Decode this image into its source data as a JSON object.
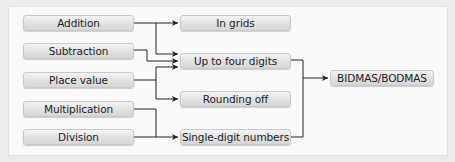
{
  "diagram": {
    "type": "flowchart",
    "left_column": [
      {
        "id": "addition",
        "label": "Addition"
      },
      {
        "id": "subtraction",
        "label": "Subtraction"
      },
      {
        "id": "place_value",
        "label": "Place value"
      },
      {
        "id": "multiplication",
        "label": "Multiplication"
      },
      {
        "id": "division",
        "label": "Division"
      }
    ],
    "middle_column": [
      {
        "id": "in_grids",
        "label": "In grids"
      },
      {
        "id": "up_to_four_digits",
        "label": "Up to four digits"
      },
      {
        "id": "rounding_off",
        "label": "Rounding off"
      },
      {
        "id": "single_digit_numbers",
        "label": "Single-digit numbers"
      }
    ],
    "right_column": [
      {
        "id": "bidmas",
        "label": "BIDMAS/BODMAS"
      }
    ],
    "edges": [
      {
        "from": "addition",
        "to": "in_grids"
      },
      {
        "from": "addition",
        "to": "up_to_four_digits"
      },
      {
        "from": "subtraction",
        "to": "up_to_four_digits"
      },
      {
        "from": "place_value",
        "to": "up_to_four_digits"
      },
      {
        "from": "place_value",
        "to": "rounding_off"
      },
      {
        "from": "multiplication",
        "to": "single_digit_numbers"
      },
      {
        "from": "division",
        "to": "single_digit_numbers"
      },
      {
        "from": "up_to_four_digits",
        "to": "bidmas"
      },
      {
        "from": "single_digit_numbers",
        "to": "bidmas"
      }
    ],
    "colors": {
      "box_fill": "#e3e3e3",
      "box_border": "#c8c8c8",
      "connector": "#222222",
      "panel": "#fafafa",
      "frame": "#ececec"
    }
  }
}
